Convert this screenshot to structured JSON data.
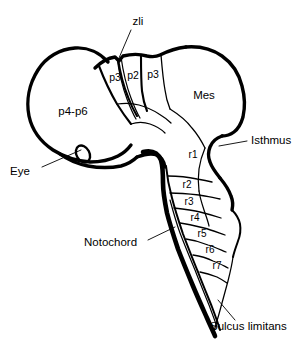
{
  "figure": {
    "background_color": "#ffffff",
    "line_color": "#000000",
    "width": 298,
    "height": 342
  },
  "regions": {
    "forebrain": {
      "label": "p4-p6",
      "name": "prosomeres-4-to-6"
    },
    "prosomeres": [
      {
        "label": "p3",
        "name": "prosomere-3-rostral"
      },
      {
        "label": "p2",
        "name": "prosomere-2"
      },
      {
        "label": "p3",
        "name": "prosomere-3-caudal"
      }
    ],
    "midbrain": {
      "label": "Mes",
      "name": "mesencephalon"
    },
    "rhombomeres": [
      {
        "label": "r1"
      },
      {
        "label": "r2"
      },
      {
        "label": "r3"
      },
      {
        "label": "r4"
      },
      {
        "label": "r5"
      },
      {
        "label": "r6"
      },
      {
        "label": "r7"
      }
    ]
  },
  "annotations": {
    "zli": {
      "label": "zli",
      "name": "zona-limitans-intrathalamica"
    },
    "eye": {
      "label": "Eye",
      "name": "optic-vesicle"
    },
    "isthmus": {
      "label": "Isthmus",
      "name": "isthmic-constriction"
    },
    "notochord": {
      "label": "Notochord",
      "name": "notochord"
    },
    "sulcus_limitans": {
      "label": "Sulcus limitans",
      "name": "sulcus-limitans"
    }
  }
}
